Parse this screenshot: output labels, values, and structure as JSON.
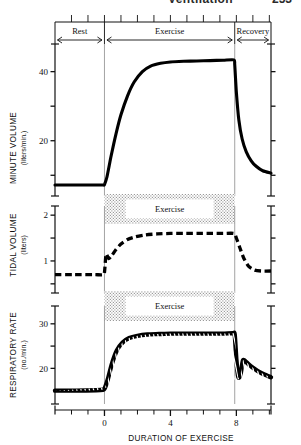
{
  "page_header": {
    "title": "Ventilation",
    "page_number": "253"
  },
  "phase_band": {
    "segments": [
      {
        "label": "Rest",
        "from": -3.0,
        "to": 0.0
      },
      {
        "label": "Exercise",
        "from": 0.0,
        "to": 7.9
      },
      {
        "label": "Recovery",
        "from": 7.9,
        "to": 10.1
      }
    ]
  },
  "exercise_box_label": "Exercise",
  "xaxis": {
    "title": "DURATION OF EXERCISE",
    "ticks_major": [
      0,
      4,
      8
    ],
    "tick_labels": [
      "0",
      "4",
      "8"
    ],
    "ticks_minor": [
      -2,
      -1,
      1,
      2,
      3,
      5,
      6,
      7,
      9,
      10
    ],
    "range": [
      -3.0,
      10.1
    ]
  },
  "panels": [
    {
      "id": "minute-volume",
      "axis_title": "MINUTE VOLUME",
      "axis_subtitle": "(liters/min.)",
      "ticks_major": [
        20,
        40
      ],
      "tick_labels": [
        "20",
        "40"
      ],
      "ticks_minor": [
        10,
        30
      ],
      "range": [
        4,
        48
      ],
      "line_style": "solid"
    },
    {
      "id": "tidal-volume",
      "axis_title": "TIDAL VOLUME",
      "axis_subtitle": "(liters)",
      "ticks_major": [
        1,
        2
      ],
      "tick_labels": [
        "1",
        "2"
      ],
      "ticks_minor": [
        0.5,
        1.5
      ],
      "range": [
        0.3,
        2.2
      ],
      "line_style": "dashed"
    },
    {
      "id": "respiratory-rate",
      "axis_title": "RESPIRATORY RATE",
      "axis_subtitle": "(no./min.)",
      "ticks_major": [
        20,
        30
      ],
      "tick_labels": [
        "20",
        "30"
      ],
      "ticks_minor": [
        25
      ],
      "range": [
        12,
        34
      ],
      "line_style": "hatched"
    }
  ],
  "chart_data": [
    {
      "type": "line",
      "title": "Minute Volume during rest, exercise and recovery",
      "xlabel": "DURATION OF EXERCISE",
      "ylabel": "MINUTE VOLUME (liters/min.)",
      "xlim": [
        -3.0,
        10.1
      ],
      "ylim": [
        4,
        48
      ],
      "yticks": [
        20,
        40
      ],
      "xticks": [
        0,
        4,
        8
      ],
      "grid": false,
      "legend": "none",
      "annotations": [
        "Rest",
        "Exercise",
        "Recovery"
      ],
      "series": [
        {
          "name": "Minute volume",
          "style": "solid",
          "x": [
            -3.0,
            -1.6,
            -0.3,
            -0.05,
            0.0,
            0.15,
            0.4,
            0.7,
            1.0,
            1.4,
            1.8,
            2.3,
            2.8,
            3.4,
            4.0,
            4.8,
            5.6,
            6.4,
            7.2,
            7.85,
            7.9,
            8.0,
            8.15,
            8.35,
            8.6,
            8.9,
            9.2,
            9.6,
            10.1
          ],
          "values": [
            7.2,
            7.2,
            7.2,
            7.2,
            7.3,
            9.5,
            15.5,
            22.0,
            27.5,
            33.0,
            37.0,
            40.0,
            41.6,
            42.4,
            42.8,
            43.0,
            43.1,
            43.2,
            43.3,
            43.4,
            42.0,
            34.0,
            26.0,
            20.5,
            16.8,
            14.2,
            12.6,
            11.3,
            10.6
          ]
        }
      ]
    },
    {
      "type": "line",
      "title": "Tidal Volume during rest, exercise and recovery",
      "xlabel": "DURATION OF EXERCISE",
      "ylabel": "TIDAL VOLUME (liters)",
      "xlim": [
        -3.0,
        10.1
      ],
      "ylim": [
        0.3,
        2.2
      ],
      "yticks": [
        1,
        2
      ],
      "xticks": [
        0,
        4,
        8
      ],
      "grid": false,
      "legend": "none",
      "annotations": [
        "Exercise"
      ],
      "series": [
        {
          "name": "Tidal volume",
          "style": "dashed",
          "x": [
            -3.0,
            -1.8,
            -0.6,
            -0.1,
            0.0,
            0.1,
            0.25,
            0.45,
            0.7,
            1.0,
            1.4,
            1.9,
            2.5,
            3.2,
            4.0,
            4.8,
            5.6,
            6.4,
            7.2,
            7.85,
            8.0,
            8.2,
            8.45,
            8.75,
            9.1,
            9.5,
            10.1
          ],
          "values": [
            0.7,
            0.7,
            0.7,
            0.7,
            0.75,
            1.15,
            1.05,
            1.12,
            1.25,
            1.37,
            1.47,
            1.53,
            1.57,
            1.59,
            1.6,
            1.6,
            1.6,
            1.6,
            1.6,
            1.6,
            1.5,
            1.3,
            1.06,
            0.88,
            0.8,
            0.78,
            0.78
          ]
        }
      ]
    },
    {
      "type": "line",
      "title": "Respiratory Rate during rest, exercise and recovery",
      "xlabel": "DURATION OF EXERCISE",
      "ylabel": "RESPIRATORY RATE (no./min.)",
      "xlim": [
        -3.0,
        10.1
      ],
      "ylim": [
        12,
        34
      ],
      "yticks": [
        20,
        30
      ],
      "xticks": [
        0,
        4,
        8
      ],
      "grid": false,
      "legend": "none",
      "annotations": [
        "Exercise"
      ],
      "series": [
        {
          "name": "Respiratory rate",
          "style": "hatched",
          "x": [
            -3.0,
            -1.7,
            -0.5,
            -0.1,
            0.0,
            0.2,
            0.45,
            0.75,
            1.1,
            1.5,
            2.0,
            2.6,
            3.3,
            4.0,
            4.8,
            5.6,
            6.4,
            7.2,
            7.8,
            7.9,
            8.0,
            8.12,
            8.25,
            8.4,
            8.6,
            8.9,
            9.3,
            9.7,
            10.1
          ],
          "values": [
            15.0,
            15.0,
            15.1,
            15.2,
            15.4,
            17.5,
            21.0,
            24.0,
            25.8,
            26.8,
            27.3,
            27.6,
            27.7,
            27.8,
            27.8,
            27.8,
            27.8,
            27.8,
            27.9,
            27.6,
            22.0,
            18.0,
            18.6,
            21.8,
            21.4,
            20.4,
            19.4,
            18.6,
            18.0
          ]
        }
      ]
    }
  ]
}
